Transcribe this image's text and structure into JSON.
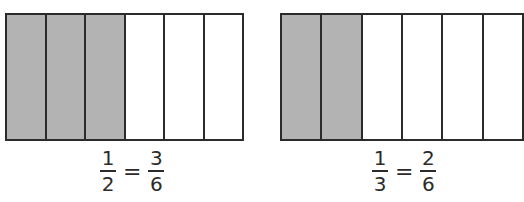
{
  "models": [
    {
      "name": "halves-to-sixths",
      "total_parts": 6,
      "shaded_parts": 3,
      "equation": {
        "left": {
          "num": "1",
          "den": "2"
        },
        "op": "=",
        "right": {
          "num": "3",
          "den": "6"
        }
      }
    },
    {
      "name": "thirds-to-sixths",
      "total_parts": 6,
      "shaded_parts": 2,
      "equation": {
        "left": {
          "num": "1",
          "den": "3"
        },
        "op": "=",
        "right": {
          "num": "2",
          "den": "6"
        }
      }
    }
  ],
  "colors": {
    "shaded": "#b3b3b3",
    "unshaded": "#ffffff",
    "line": "#2b2b2b"
  }
}
